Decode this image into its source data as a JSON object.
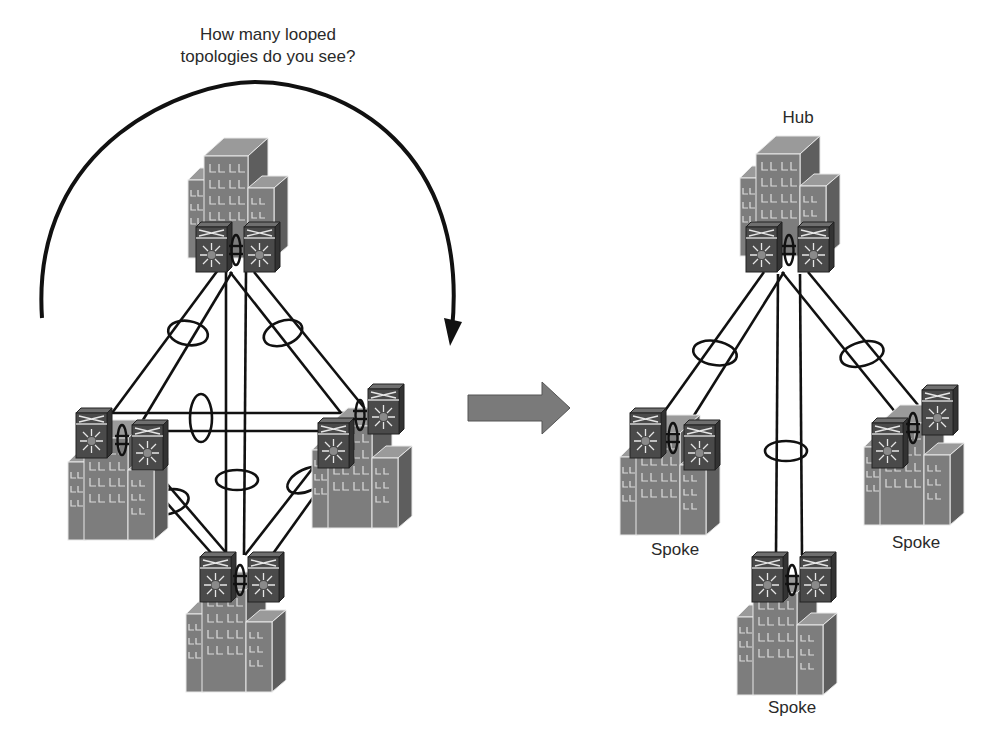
{
  "figure": {
    "question": [
      "How many looped",
      "topologies do you see?"
    ],
    "transform_arrow": "right-arrow",
    "left_diagram": {
      "description": "Full mesh of four sites, each with a pair of switches joined by vPC",
      "sites": [
        "top-site",
        "left-site",
        "right-site",
        "bottom-site"
      ],
      "cycle_arrow": "curved-arrow-clockwise"
    },
    "right_diagram": {
      "description": "Hub-and-spoke topology",
      "labels": {
        "hub": "Hub",
        "spoke_left": "Spoke",
        "spoke_right": "Spoke",
        "spoke_bottom": "Spoke"
      }
    },
    "colors": {
      "building": "#7d7d7d",
      "switch": "#4a4a4a",
      "line": "#111111",
      "arrow": "#7a7a7a",
      "text": "#2a2a2a"
    }
  }
}
